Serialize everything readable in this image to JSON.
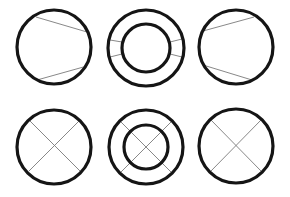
{
  "diagram": {
    "title": "",
    "background": "#ffffff",
    "stroke_color": "#151515",
    "line_color": "#7a7a7a",
    "figures": [
      {
        "id": "top-left",
        "label": "",
        "shape": "circle with two chords",
        "outer": {
          "cx": 54,
          "cy": 47,
          "r": 37
        },
        "lines": [
          [
            36,
            17,
            87,
            32
          ],
          [
            37,
            80,
            87,
            66
          ]
        ]
      },
      {
        "id": "top-middle",
        "label": "",
        "shape": "annulus with side spokes",
        "outer": {
          "cx": 146,
          "cy": 48,
          "r": 38
        },
        "inner": {
          "cx": 146,
          "cy": 48,
          "r": 24
        },
        "lines": [
          [
            110,
            40,
            122,
            42
          ],
          [
            110,
            57,
            122,
            54
          ],
          [
            170,
            42,
            182,
            39
          ],
          [
            170,
            54,
            182,
            57
          ]
        ]
      },
      {
        "id": "top-right",
        "label": "",
        "shape": "circle with two chords",
        "outer": {
          "cx": 236,
          "cy": 47,
          "r": 37
        },
        "lines": [
          [
            203,
            31,
            254,
            17
          ],
          [
            203,
            65,
            252,
            80
          ]
        ]
      },
      {
        "id": "bottom-left",
        "label": "",
        "shape": "circle with cross",
        "outer": {
          "cx": 54,
          "cy": 147,
          "r": 37
        },
        "lines": [
          [
            29,
            120,
            80,
            171
          ],
          [
            80,
            120,
            29,
            171
          ]
        ]
      },
      {
        "id": "bottom-middle",
        "label": "",
        "shape": "annulus with cross",
        "outer": {
          "cx": 146,
          "cy": 147,
          "r": 37
        },
        "inner": {
          "cx": 146,
          "cy": 147,
          "r": 22
        },
        "lines": [
          [
            120,
            121,
            172,
            173
          ],
          [
            172,
            121,
            120,
            173
          ]
        ]
      },
      {
        "id": "bottom-right",
        "label": "",
        "shape": "circle with cross",
        "outer": {
          "cx": 236,
          "cy": 146,
          "r": 37
        },
        "lines": [
          [
            211,
            120,
            261,
            171
          ],
          [
            261,
            120,
            211,
            171
          ]
        ]
      }
    ]
  }
}
